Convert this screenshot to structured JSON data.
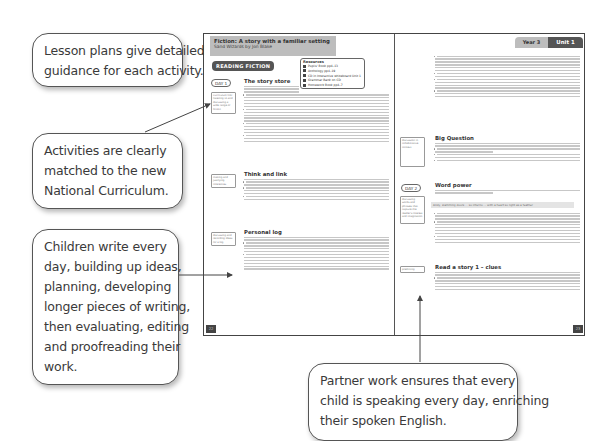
{
  "callouts": {
    "lesson_plans": [
      "Lesson plans give detailed",
      "guidance for each activity."
    ],
    "curriculum": [
      "Activities are clearly",
      "matched to the new",
      "National Curriculum."
    ],
    "writing": [
      "Children write every",
      "day, building up ideas,",
      "planning, developing",
      "longer pieces of writing,",
      "then evaluating, editing",
      "and proofreading their",
      "work."
    ],
    "partner": [
      "Partner work ensures that every",
      "child is speaking every day, enriching",
      "their spoken English."
    ]
  },
  "left_page": {
    "title": "Fiction: A story with a familiar setting",
    "subtitle": "Sand Wizards by Jon Blake",
    "section_badge": "READING FICTION",
    "resources": {
      "title": "Resources",
      "items": [
        "Pupils' Book pp4–13",
        "Anthology pp4–19",
        "CD in Interactive whiteboard Unit 1",
        "Grammar Bank on CD",
        "Homework Book pp4–7"
      ]
    },
    "day_badge": "DAY 1",
    "sections": [
      {
        "title": "The story store",
        "note": "Curriculum link: listening to and discussing a wide range of fiction"
      },
      {
        "title": "Think and link",
        "note": "making and justifying inferences"
      },
      {
        "title": "Personal log",
        "note": "discussing and recording ideas for a log"
      }
    ],
    "page_number": "22"
  },
  "right_page": {
    "tab_year": "Year 3",
    "tab_unit": "Unit 1",
    "day_badge": "DAY 2",
    "sections": [
      {
        "title": "Big Question",
        "note": "discussion in collaborative context"
      },
      {
        "title": "Word power",
        "note": "discussing words and phrases that capture the reader's interest and imagination"
      },
      {
        "title": "Read a story 1 – clues",
        "note": "predicting"
      }
    ],
    "quote": "Andy, slamming doors ... so inferno ... with a heart so light as a feather",
    "page_number": "23"
  }
}
